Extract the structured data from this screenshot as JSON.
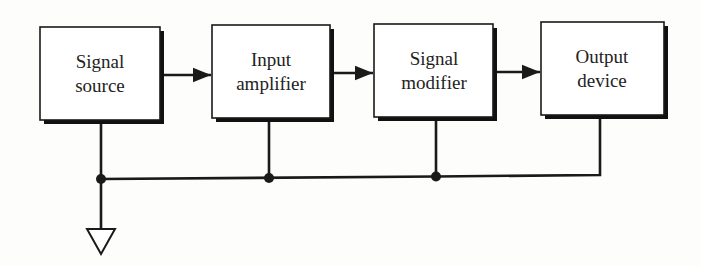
{
  "diagram": {
    "type": "block-diagram",
    "colors": {
      "background": "#fdfdfb",
      "stroke": "#1a1a1a",
      "box_fill": "#ffffff",
      "shadow": "#111111",
      "text": "#222222"
    },
    "blocks": [
      {
        "id": "signal-source",
        "line1": "Signal",
        "line2": "source",
        "x": 40,
        "y": 27,
        "w": 120,
        "h": 93
      },
      {
        "id": "input-amplifier",
        "line1": "Input",
        "line2": "amplifier",
        "x": 212,
        "y": 25,
        "w": 118,
        "h": 93
      },
      {
        "id": "signal-modifier",
        "line1": "Signal",
        "line2": "modifier",
        "x": 374,
        "y": 24,
        "w": 119,
        "h": 93
      },
      {
        "id": "output-device",
        "line1": "Output",
        "line2": "device",
        "x": 541,
        "y": 22,
        "w": 123,
        "h": 93
      }
    ],
    "arrows": [
      {
        "from": "signal-source",
        "to": "input-amplifier"
      },
      {
        "from": "input-amplifier",
        "to": "signal-modifier"
      },
      {
        "from": "signal-modifier",
        "to": "output-device"
      }
    ],
    "common_bus": {
      "y": 178,
      "junctions_x": [
        101,
        269,
        436
      ],
      "end_x": 600,
      "ground_symbol": "ground-triangle"
    }
  }
}
